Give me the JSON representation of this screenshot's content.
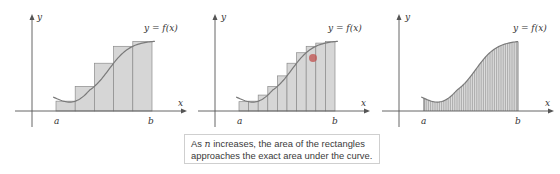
{
  "caption": {
    "line1_prefix": "As ",
    "line1_var": "n",
    "line1_suffix": " increases, the area of the rectangles",
    "line2": "approaches the exact area under the curve."
  },
  "panels": [
    {
      "id": "panel-1",
      "rectangles": 5,
      "function_label": "y = f(x)",
      "x_axis_label": "x",
      "y_axis_label": "y",
      "a_label": "a",
      "b_label": "b"
    },
    {
      "id": "panel-2",
      "rectangles": 10,
      "function_label": "y = f(x)",
      "x_axis_label": "x",
      "y_axis_label": "y",
      "a_label": "a",
      "b_label": "b"
    },
    {
      "id": "panel-3",
      "rectangles": "many",
      "function_label": "y = f(x)",
      "x_axis_label": "x",
      "y_axis_label": "y",
      "a_label": "a",
      "b_label": "b"
    }
  ],
  "colors": {
    "rect_fill": "#d6d6d6",
    "rect_stroke": "#8c8c8c",
    "curve": "#7a7a7a",
    "axis": "#555555",
    "highlight_dot": "#c0504d"
  }
}
